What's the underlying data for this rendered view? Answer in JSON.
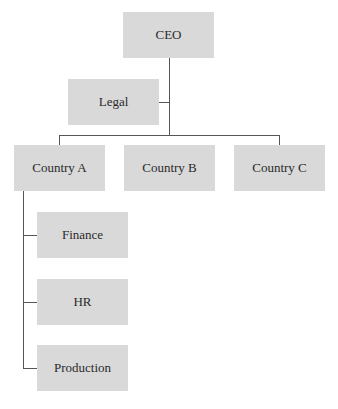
{
  "diagram": {
    "type": "org-chart",
    "colors": {
      "box_fill": "#d9d9d9",
      "connector": "#555555",
      "text": "#2a2a2a"
    },
    "nodes": {
      "ceo": {
        "label": "CEO"
      },
      "legal": {
        "label": "Legal"
      },
      "country_a": {
        "label": "Country A"
      },
      "country_b": {
        "label": "Country B"
      },
      "country_c": {
        "label": "Country C"
      },
      "finance": {
        "label": "Finance"
      },
      "hr": {
        "label": "HR"
      },
      "production": {
        "label": "Production"
      }
    },
    "edges": [
      [
        "CEO",
        "Legal"
      ],
      [
        "CEO",
        "Country A"
      ],
      [
        "CEO",
        "Country B"
      ],
      [
        "CEO",
        "Country C"
      ],
      [
        "Country A",
        "Finance"
      ],
      [
        "Country A",
        "HR"
      ],
      [
        "Country A",
        "Production"
      ]
    ]
  }
}
